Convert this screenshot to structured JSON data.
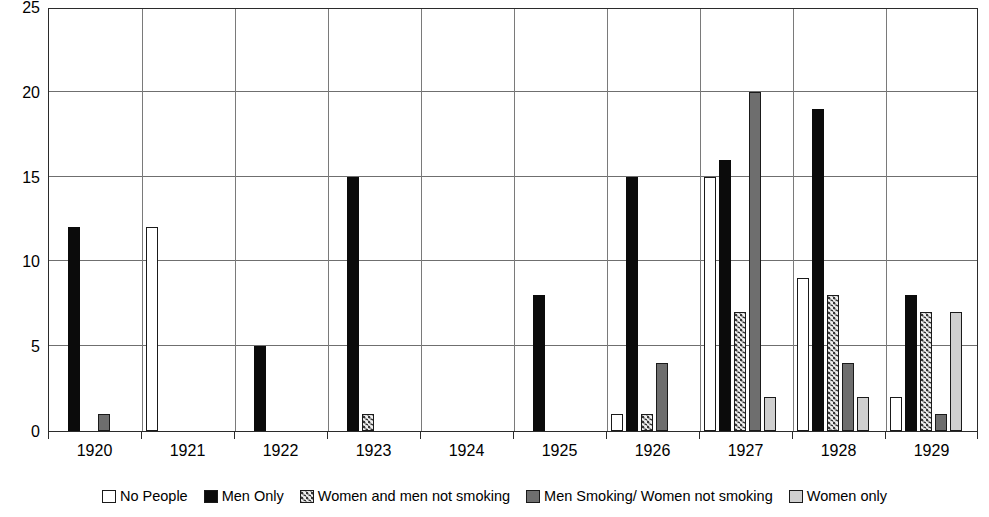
{
  "chart_data": {
    "type": "bar",
    "title": "",
    "subtitle": "",
    "xlabel": "",
    "ylabel": "",
    "ylim": [
      0,
      25
    ],
    "yticks": [
      0,
      5,
      10,
      15,
      20,
      25
    ],
    "grid": true,
    "legend_position": "bottom",
    "categories": [
      "1920",
      "1921",
      "1922",
      "1923",
      "1924",
      "1925",
      "1926",
      "1927",
      "1928",
      "1929"
    ],
    "series": [
      {
        "name": "No People",
        "color": "#ffffff",
        "pattern": "solid",
        "values": [
          0,
          12,
          0,
          0,
          0,
          0,
          1,
          15,
          9,
          2
        ]
      },
      {
        "name": "Men Only",
        "color": "#0b0b0b",
        "pattern": "solid",
        "values": [
          12,
          0,
          5,
          15,
          0,
          8,
          15,
          16,
          19,
          8
        ]
      },
      {
        "name": "Women and men not smoking",
        "color": "#9b9b9b",
        "pattern": "hatched",
        "values": [
          0,
          0,
          0,
          1,
          0,
          0,
          1,
          7,
          8,
          7
        ]
      },
      {
        "name": "Men Smoking/ Women not smoking",
        "color": "#6e6e6e",
        "pattern": "solid",
        "values": [
          1,
          0,
          0,
          0,
          0,
          0,
          4,
          20,
          4,
          1
        ]
      },
      {
        "name": "Women only",
        "color": "#cfcfcf",
        "pattern": "solid",
        "values": [
          0,
          0,
          0,
          0,
          0,
          0,
          0,
          2,
          2,
          7
        ]
      }
    ]
  },
  "legend": {
    "items": [
      {
        "label": "No People"
      },
      {
        "label": "Men Only"
      },
      {
        "label": "Women and men not smoking"
      },
      {
        "label": "Men Smoking/ Women not smoking"
      },
      {
        "label": "Women only"
      }
    ]
  }
}
